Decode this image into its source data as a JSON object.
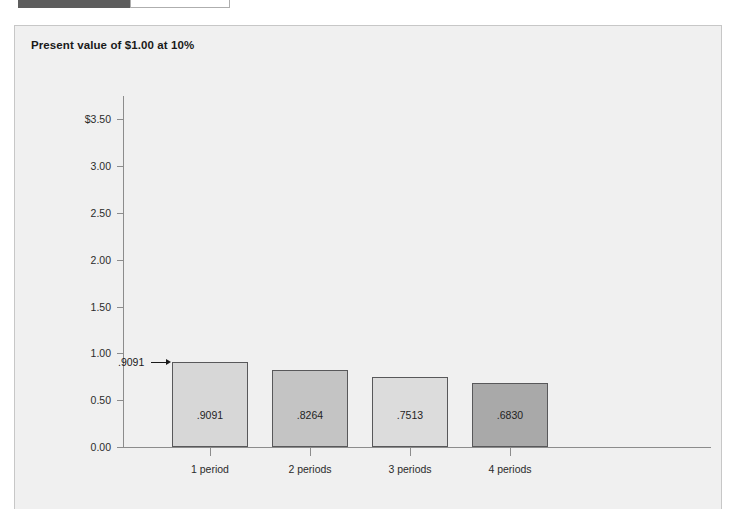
{
  "top_chrome": {
    "field_value": "",
    "faint_text": "· · ·"
  },
  "panel": {
    "title": "Present value of $1.00 at 10%"
  },
  "chart_data": {
    "type": "bar",
    "title": "Present value of $1.00 at 10%",
    "xlabel": "",
    "ylabel": "",
    "ylim": [
      0.0,
      3.75
    ],
    "grid": false,
    "legend": null,
    "categories": [
      "1 period",
      "2 periods",
      "3 periods",
      "4 periods"
    ],
    "values": [
      0.9091,
      0.8264,
      0.7513,
      0.683
    ],
    "value_labels": [
      ".9091",
      ".8264",
      ".7513",
      ".6830"
    ],
    "bar_colors": [
      "#d7d7d7",
      "#c4c4c4",
      "#dcdcdc",
      "#a9a9a9"
    ],
    "bar_edge_color": "#58585a",
    "y_ticks": [
      {
        "value": 3.5,
        "label": "$3.50"
      },
      {
        "value": 3.0,
        "label": "3.00"
      },
      {
        "value": 2.5,
        "label": "2.50"
      },
      {
        "value": 2.0,
        "label": "2.00"
      },
      {
        "value": 1.5,
        "label": "1.50"
      },
      {
        "value": 1.0,
        "label": "1.00"
      },
      {
        "value": 0.5,
        "label": "0.50"
      },
      {
        "value": 0.0,
        "label": "0.00"
      }
    ],
    "annotations": [
      {
        "text": ".9091",
        "points_to_category": "1 period",
        "points_to_value": 0.9091
      }
    ]
  }
}
